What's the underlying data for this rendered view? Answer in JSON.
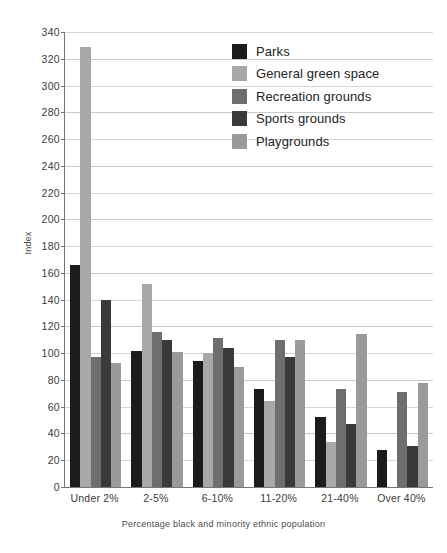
{
  "chart_data": {
    "type": "bar",
    "title": "",
    "subtitle": "",
    "xlabel": "Percentage black and minority ethnic population",
    "ylabel": "Index",
    "ylim": [
      0,
      340
    ],
    "ytick_step": 20,
    "yticks": [
      0,
      20,
      40,
      60,
      80,
      100,
      120,
      140,
      160,
      180,
      200,
      220,
      240,
      260,
      280,
      300,
      320,
      340
    ],
    "grid": true,
    "grid_axis": "y",
    "legend_position": "top-right-inside",
    "categories": [
      "Under 2%",
      "2-5%",
      "6-10%",
      "11-20%",
      "21-40%",
      "Over 40%"
    ],
    "series": [
      {
        "name": "Parks",
        "color": "#1c1c1c",
        "values": [
          166,
          102,
          94,
          73,
          52,
          28
        ]
      },
      {
        "name": "General green space",
        "color": "#a8a8a8",
        "values": [
          329,
          152,
          100,
          64,
          34,
          0
        ]
      },
      {
        "name": "Recreation grounds",
        "color": "#6e6e6e",
        "values": [
          97,
          116,
          111,
          110,
          73,
          71
        ]
      },
      {
        "name": "Sports grounds",
        "color": "#3a3a3a",
        "values": [
          140,
          110,
          104,
          97,
          47,
          31
        ]
      },
      {
        "name": "Playgrounds",
        "color": "#9a9a9a",
        "values": [
          93,
          101,
          90,
          110,
          114,
          78
        ]
      }
    ]
  },
  "legend": {
    "entries": [
      {
        "label": "Parks"
      },
      {
        "label": "General green space"
      },
      {
        "label": "Recreation grounds"
      },
      {
        "label": "Sports grounds"
      },
      {
        "label": "Playgrounds"
      }
    ]
  },
  "axes": {
    "y_title": "Index",
    "x_title": "Percentage black and minority ethnic population"
  },
  "colors": {
    "axis_line": "#777777",
    "gridline": "#c9c9c9",
    "text": "#3b3b3b",
    "background": "#ffffff"
  }
}
